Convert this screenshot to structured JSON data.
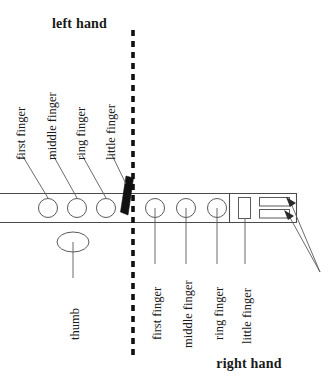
{
  "figure": {
    "title_top": "left hand",
    "title_bottom": "right hand",
    "left_hand": {
      "label": "left hand",
      "fingers": [
        {
          "name": "first finger",
          "key_cx": 48,
          "label_x": 25,
          "label_y": 162
        },
        {
          "name": "middle finger",
          "key_cx": 77,
          "label_x": 56,
          "label_y": 162
        },
        {
          "name": "ring finger",
          "key_cx": 106,
          "label_x": 85,
          "label_y": 162
        },
        {
          "name": "little finger",
          "key_cx": 130,
          "label_x": 116,
          "label_y": 162
        }
      ],
      "thumb": {
        "name": "thumb",
        "cx": 73,
        "cy": 242
      }
    },
    "right_hand": {
      "label": "right hand",
      "fingers": [
        {
          "name": "first finger",
          "key_cx": 155,
          "label_x": 160,
          "label_y": 268
        },
        {
          "name": "middle finger",
          "key_cx": 186,
          "label_x": 191,
          "label_y": 268
        },
        {
          "name": "ring finger",
          "key_cx": 217,
          "label_x": 222,
          "label_y": 268
        },
        {
          "name": "little finger",
          "key_cx": 245,
          "label_x": 250,
          "label_y": 268
        }
      ]
    },
    "divider": {
      "name": "center-dashed-divider",
      "x": 133,
      "y1": 30,
      "y2": 356
    },
    "keyboard_bar": {
      "x": 0,
      "y": 193,
      "width": 297,
      "height": 29
    },
    "black_key": {
      "name": "black-key-mark",
      "x": 126,
      "y": 176
    },
    "callout_arrows": {
      "origin_x": 320,
      "origin_y": 272,
      "targets": [
        {
          "x": 285,
          "y": 199
        },
        {
          "x": 283,
          "y": 212
        }
      ]
    },
    "colors": {
      "ink": "#1a1a1a",
      "line": "#5a5a5a",
      "divider": "#111111",
      "background": "#ffffff"
    }
  }
}
